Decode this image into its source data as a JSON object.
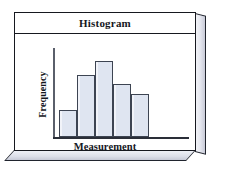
{
  "figure": {
    "title": "Histogram",
    "frame_style": "3d-beveled-box",
    "colors": {
      "bar_fill": "#dfe5f1",
      "bar_stroke": "#3d4452",
      "frame_stroke": "#16181f",
      "axis": "#2a2e38",
      "background": "#ffffff"
    }
  },
  "chart_data": {
    "type": "bar",
    "title": "Histogram",
    "xlabel": "Measurement",
    "ylabel": "Frequency",
    "categories": [
      "1",
      "2",
      "3",
      "4",
      "5"
    ],
    "values": [
      3,
      7,
      8.5,
      6,
      4.8
    ],
    "ylim": [
      0,
      10
    ],
    "xlim": [
      0,
      5
    ],
    "grid": false,
    "legend": false,
    "tick_labels_shown": false,
    "bars": [
      {
        "index": 1,
        "height": 3,
        "left_pct": 0,
        "width_pct": 20
      },
      {
        "index": 2,
        "height": 7,
        "left_pct": 20,
        "width_pct": 20
      },
      {
        "index": 3,
        "height": 8.5,
        "left_pct": 40,
        "width_pct": 20
      },
      {
        "index": 4,
        "height": 6,
        "left_pct": 60,
        "width_pct": 20
      },
      {
        "index": 5,
        "height": 4.8,
        "left_pct": 80,
        "width_pct": 20
      }
    ]
  }
}
